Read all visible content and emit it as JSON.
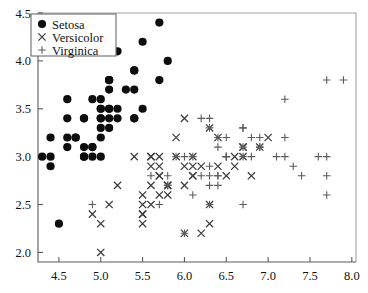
{
  "chart_data": {
    "type": "scatter",
    "title": "",
    "xlabel": "",
    "ylabel": "",
    "xlim": [
      4.25,
      8.05
    ],
    "ylim": [
      1.9,
      4.5
    ],
    "grid": false,
    "xticks": [
      "4.5",
      "5.0",
      "5.5",
      "6.0",
      "6.5",
      "7.0",
      "7.5",
      "8.0"
    ],
    "xtick_values": [
      4.5,
      5.0,
      5.5,
      6.0,
      6.5,
      7.0,
      7.5,
      8.0
    ],
    "yticks": [
      "2.0",
      "2.5",
      "3.0",
      "3.5",
      "4.0",
      "4.5"
    ],
    "ytick_values": [
      2.0,
      2.5,
      3.0,
      3.5,
      4.0,
      4.5
    ],
    "legend_position": "top-left",
    "series": [
      {
        "name": "Setosa",
        "marker": "filled-circle",
        "color": "#0d0d0d",
        "points": [
          [
            5.1,
            3.5
          ],
          [
            4.9,
            3.0
          ],
          [
            4.7,
            3.2
          ],
          [
            4.6,
            3.1
          ],
          [
            5.0,
            3.6
          ],
          [
            5.4,
            3.9
          ],
          [
            4.6,
            3.4
          ],
          [
            5.0,
            3.4
          ],
          [
            4.4,
            2.9
          ],
          [
            4.9,
            3.1
          ],
          [
            5.4,
            3.7
          ],
          [
            4.8,
            3.4
          ],
          [
            4.8,
            3.0
          ],
          [
            4.3,
            3.0
          ],
          [
            5.8,
            4.0
          ],
          [
            5.7,
            4.4
          ],
          [
            5.4,
            3.9
          ],
          [
            5.1,
            3.5
          ],
          [
            5.7,
            3.8
          ],
          [
            5.1,
            3.8
          ],
          [
            5.4,
            3.4
          ],
          [
            5.1,
            3.7
          ],
          [
            4.6,
            3.6
          ],
          [
            5.1,
            3.3
          ],
          [
            4.8,
            3.4
          ],
          [
            5.0,
            3.0
          ],
          [
            5.0,
            3.4
          ],
          [
            5.2,
            3.5
          ],
          [
            5.2,
            3.4
          ],
          [
            4.7,
            3.2
          ],
          [
            4.8,
            3.1
          ],
          [
            5.4,
            3.4
          ],
          [
            5.2,
            4.1
          ],
          [
            5.5,
            4.2
          ],
          [
            4.9,
            3.1
          ],
          [
            5.0,
            3.2
          ],
          [
            5.5,
            3.5
          ],
          [
            4.9,
            3.6
          ],
          [
            4.4,
            3.0
          ],
          [
            5.1,
            3.4
          ],
          [
            5.0,
            3.5
          ],
          [
            4.5,
            2.3
          ],
          [
            4.4,
            3.2
          ],
          [
            5.0,
            3.5
          ],
          [
            5.1,
            3.8
          ],
          [
            4.8,
            3.0
          ],
          [
            5.1,
            3.8
          ],
          [
            4.6,
            3.2
          ],
          [
            5.3,
            3.7
          ],
          [
            5.0,
            3.3
          ]
        ]
      },
      {
        "name": "Versicolor",
        "marker": "cross-x",
        "color": "#3c3c3c",
        "points": [
          [
            7.0,
            3.2
          ],
          [
            6.4,
            3.2
          ],
          [
            6.9,
            3.1
          ],
          [
            5.5,
            2.3
          ],
          [
            6.5,
            2.8
          ],
          [
            5.7,
            2.8
          ],
          [
            6.3,
            3.3
          ],
          [
            4.9,
            2.4
          ],
          [
            6.6,
            2.9
          ],
          [
            5.2,
            2.7
          ],
          [
            5.0,
            2.0
          ],
          [
            5.9,
            3.0
          ],
          [
            6.0,
            2.2
          ],
          [
            6.1,
            2.9
          ],
          [
            5.6,
            2.9
          ],
          [
            6.7,
            3.1
          ],
          [
            5.6,
            3.0
          ],
          [
            5.8,
            2.7
          ],
          [
            6.2,
            2.2
          ],
          [
            5.6,
            2.5
          ],
          [
            5.9,
            3.2
          ],
          [
            6.1,
            2.8
          ],
          [
            6.3,
            2.5
          ],
          [
            6.1,
            2.8
          ],
          [
            6.4,
            2.9
          ],
          [
            6.6,
            3.0
          ],
          [
            6.8,
            2.8
          ],
          [
            6.7,
            3.0
          ],
          [
            6.0,
            2.9
          ],
          [
            5.7,
            2.6
          ],
          [
            5.5,
            2.4
          ],
          [
            5.5,
            2.4
          ],
          [
            5.8,
            2.7
          ],
          [
            6.0,
            2.7
          ],
          [
            5.4,
            3.0
          ],
          [
            6.0,
            3.4
          ],
          [
            6.7,
            3.1
          ],
          [
            6.3,
            2.3
          ],
          [
            5.6,
            3.0
          ],
          [
            5.5,
            2.5
          ],
          [
            5.5,
            2.6
          ],
          [
            6.1,
            3.0
          ],
          [
            5.8,
            2.6
          ],
          [
            5.0,
            2.3
          ],
          [
            5.6,
            2.7
          ],
          [
            5.7,
            3.0
          ],
          [
            5.7,
            2.9
          ],
          [
            6.2,
            2.9
          ],
          [
            5.1,
            2.5
          ],
          [
            5.7,
            2.8
          ]
        ]
      },
      {
        "name": "Virginica",
        "marker": "plus",
        "color": "#5c5c5c",
        "points": [
          [
            6.3,
            3.3
          ],
          [
            5.8,
            2.7
          ],
          [
            7.1,
            3.0
          ],
          [
            6.3,
            2.9
          ],
          [
            6.5,
            3.0
          ],
          [
            7.6,
            3.0
          ],
          [
            4.9,
            2.5
          ],
          [
            7.3,
            2.9
          ],
          [
            6.7,
            2.5
          ],
          [
            7.2,
            3.6
          ],
          [
            6.5,
            3.2
          ],
          [
            6.4,
            2.7
          ],
          [
            6.8,
            3.0
          ],
          [
            5.7,
            2.5
          ],
          [
            5.8,
            2.8
          ],
          [
            6.4,
            3.2
          ],
          [
            6.5,
            3.0
          ],
          [
            7.7,
            3.8
          ],
          [
            7.7,
            2.6
          ],
          [
            6.0,
            2.2
          ],
          [
            6.9,
            3.2
          ],
          [
            5.6,
            2.8
          ],
          [
            7.7,
            2.8
          ],
          [
            6.3,
            2.7
          ],
          [
            6.7,
            3.3
          ],
          [
            7.2,
            3.2
          ],
          [
            6.2,
            2.8
          ],
          [
            6.1,
            3.0
          ],
          [
            6.4,
            2.8
          ],
          [
            7.2,
            3.0
          ],
          [
            7.4,
            2.8
          ],
          [
            7.9,
            3.8
          ],
          [
            6.4,
            2.8
          ],
          [
            6.3,
            2.8
          ],
          [
            6.1,
            2.6
          ],
          [
            7.7,
            3.0
          ],
          [
            6.3,
            3.4
          ],
          [
            6.4,
            3.1
          ],
          [
            6.0,
            3.0
          ],
          [
            6.9,
            3.1
          ],
          [
            6.7,
            3.1
          ],
          [
            6.9,
            3.1
          ],
          [
            5.8,
            2.7
          ],
          [
            6.8,
            3.2
          ],
          [
            6.7,
            3.3
          ],
          [
            6.7,
            3.0
          ],
          [
            6.3,
            2.5
          ],
          [
            6.5,
            3.0
          ],
          [
            6.2,
            3.4
          ],
          [
            5.9,
            3.0
          ]
        ]
      }
    ]
  }
}
